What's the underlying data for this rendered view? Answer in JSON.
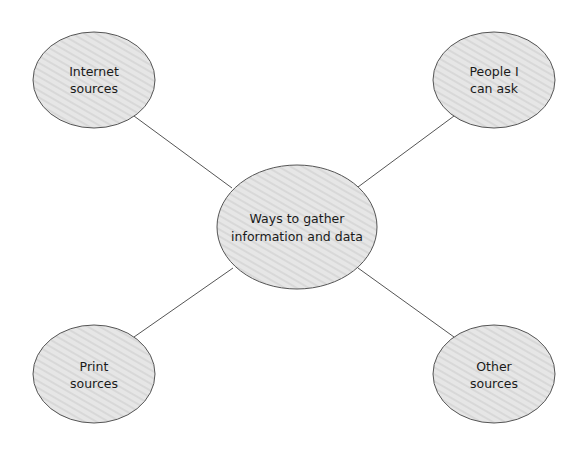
{
  "diagram": {
    "type": "concept-map",
    "fill_color": "#e4e4e4",
    "stroke_color": "#555555",
    "center": {
      "line1": "Ways to gather",
      "line2": "information and data"
    },
    "nodes": [
      {
        "id": "internet",
        "line1": "Internet",
        "line2": "sources"
      },
      {
        "id": "people",
        "line1": "People I",
        "line2": "can ask"
      },
      {
        "id": "print",
        "line1": "Print",
        "line2": "sources"
      },
      {
        "id": "other",
        "line1": "Other",
        "line2": "sources"
      }
    ]
  }
}
